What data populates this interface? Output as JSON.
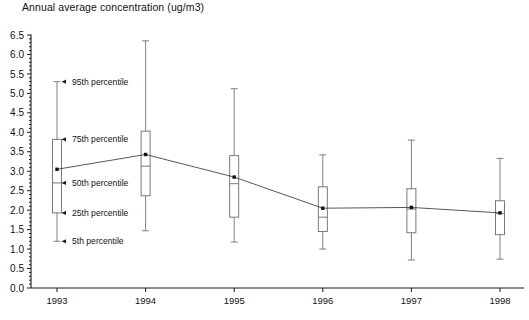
{
  "chart": {
    "title": "Annual average concentration (ug/m3)"
  },
  "chart_data": {
    "type": "box",
    "title": "Annual average concentration (ug/m3)",
    "subtitle": "",
    "xlabel": "",
    "ylabel": "Annual average concentration (ug/m3)",
    "categories": [
      "1993",
      "1994",
      "1995",
      "1996",
      "1997",
      "1998"
    ],
    "ylim": [
      0.0,
      6.5
    ],
    "xlim": [
      0,
      7
    ],
    "grid": false,
    "legend_position": "none",
    "ytick_labels": [
      "0.0",
      "0.5",
      "1.0",
      "1.5",
      "2.0",
      "2.5",
      "3.0",
      "3.5",
      "4.0",
      "4.5",
      "5.0",
      "5.5",
      "6.0",
      "6.5"
    ],
    "ytick_values": [
      0.0,
      0.5,
      1.0,
      1.5,
      2.0,
      2.5,
      3.0,
      3.5,
      4.0,
      4.5,
      5.0,
      5.5,
      6.0,
      6.5
    ],
    "ytick_minor_step": 0.1,
    "xtick_labels": [
      "1993",
      "1994",
      "1995",
      "1996",
      "1997",
      "1998"
    ],
    "boxes": [
      {
        "category": "1993",
        "p5": 1.2,
        "p25": 1.93,
        "p50": 2.7,
        "p75": 3.82,
        "p95": 5.3,
        "mean": 3.05
      },
      {
        "category": "1994",
        "p5": 1.47,
        "p25": 2.37,
        "p50": 3.13,
        "p75": 4.03,
        "p95": 6.35,
        "mean": 3.43
      },
      {
        "category": "1995",
        "p5": 1.18,
        "p25": 1.82,
        "p50": 2.68,
        "p75": 3.4,
        "p95": 5.12,
        "mean": 2.85
      },
      {
        "category": "1996",
        "p5": 1.0,
        "p25": 1.45,
        "p50": 1.82,
        "p75": 2.6,
        "p95": 3.42,
        "mean": 2.05
      },
      {
        "category": "1997",
        "p5": 0.72,
        "p25": 1.42,
        "p50": 2.03,
        "p75": 2.55,
        "p95": 3.8,
        "mean": 2.07
      },
      {
        "category": "1998",
        "p5": 0.74,
        "p25": 1.37,
        "p50": 1.92,
        "p75": 2.24,
        "p95": 3.33,
        "mean": 1.93
      }
    ],
    "series": [
      {
        "name": "Mean annual average concentration",
        "values": [
          3.05,
          3.43,
          2.85,
          2.05,
          2.07,
          1.93
        ]
      }
    ],
    "annotations": [
      {
        "label": "95th percentile",
        "target_category": "1993",
        "target_value": 5.3
      },
      {
        "label": "75th percentile",
        "target_category": "1993",
        "target_value": 3.82
      },
      {
        "label": "50th percentile",
        "target_category": "1993",
        "target_value": 2.7
      },
      {
        "label": "25th percentile",
        "target_category": "1993",
        "target_value": 1.93
      },
      {
        "label": "5th percentile",
        "target_category": "1993",
        "target_value": 1.2
      }
    ]
  },
  "colors": {
    "axis": "#1a1a1a",
    "box_stroke": "#6b6b6b",
    "trend_line": "#3a3a3a",
    "mean_marker": "#111111",
    "background": "#ffffff",
    "text": "#111111"
  }
}
